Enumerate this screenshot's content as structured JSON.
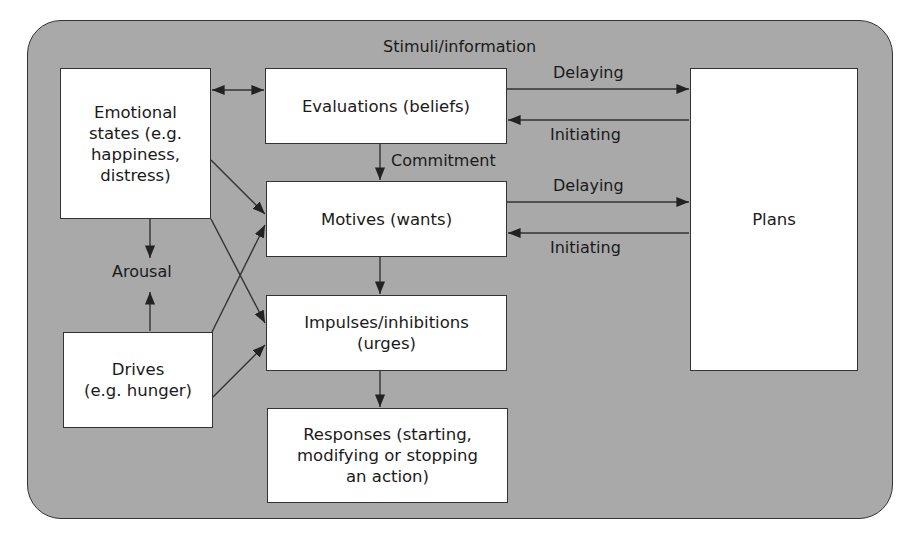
{
  "diagram": {
    "container_label": "Stimuli/information",
    "nodes": {
      "emotional": {
        "label": "Emotional states (e.g. happiness, distress)",
        "lines": [
          "Emotional",
          "states (e.g.",
          "happiness,",
          "distress)"
        ]
      },
      "evaluations": {
        "label": "Evaluations (beliefs)"
      },
      "motives": {
        "label": "Motives (wants)"
      },
      "impulses": {
        "label": "Impulses/inhibitions (urges)",
        "lines": [
          "Impulses/inhibitions",
          "(urges)"
        ]
      },
      "responses": {
        "label": "Responses (starting, modifying or stopping an action)",
        "lines": [
          "Responses (starting,",
          "modifying or stopping",
          "an action)"
        ]
      },
      "drives": {
        "label": "Drives (e.g. hunger)",
        "lines": [
          "Drives",
          "(e.g. hunger)"
        ]
      },
      "plans": {
        "label": "Plans"
      },
      "arousal": {
        "label": "Arousal"
      }
    },
    "edge_labels": {
      "commitment": "Commitment",
      "delaying_1": "Delaying",
      "initiating_1": "Initiating",
      "delaying_2": "Delaying",
      "initiating_2": "Initiating"
    },
    "edges": [
      {
        "from": "emotional",
        "to": "evaluations",
        "bidirectional": true
      },
      {
        "from": "evaluations",
        "to": "motives",
        "label": "Commitment"
      },
      {
        "from": "evaluations",
        "to": "plans",
        "label": "Delaying"
      },
      {
        "from": "plans",
        "to": "evaluations",
        "label": "Initiating"
      },
      {
        "from": "motives",
        "to": "plans",
        "label": "Delaying"
      },
      {
        "from": "plans",
        "to": "motives",
        "label": "Initiating"
      },
      {
        "from": "motives",
        "to": "impulses"
      },
      {
        "from": "impulses",
        "to": "responses"
      },
      {
        "from": "emotional",
        "to": "arousal"
      },
      {
        "from": "drives",
        "to": "arousal"
      },
      {
        "from": "emotional",
        "to": "motives"
      },
      {
        "from": "emotional",
        "to": "impulses"
      },
      {
        "from": "drives",
        "to": "motives"
      },
      {
        "from": "drives",
        "to": "impulses"
      }
    ],
    "colors": {
      "background": "#a9a9a9",
      "box": "#ffffff",
      "stroke": "#333333"
    }
  }
}
